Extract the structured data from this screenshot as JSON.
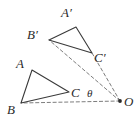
{
  "figure": {
    "background_color": "#ffffff",
    "stroke_color": "#3a3a3a",
    "dash_color": "#6e6e6e",
    "width": 139,
    "height": 124
  },
  "labels": {
    "A": "A",
    "B": "B",
    "C": "C",
    "A_prime": "A′",
    "B_prime": "B′",
    "C_prime": "C′",
    "theta": "θ",
    "O": "O"
  },
  "geometry": {
    "triangle_original": {
      "name": "ABC",
      "vertices": [
        {
          "label": "A",
          "x": 32,
          "y": 70
        },
        {
          "label": "B",
          "x": 21,
          "y": 103
        },
        {
          "label": "C",
          "x": 69,
          "y": 92
        }
      ],
      "style": "solid"
    },
    "triangle_image": {
      "name": "A′B′C′",
      "vertices": [
        {
          "label": "A′",
          "x": 76,
          "y": 27
        },
        {
          "label": "B′",
          "x": 49,
          "y": 40
        },
        {
          "label": "C′",
          "x": 92,
          "y": 53
        }
      ],
      "style": "solid"
    },
    "center": {
      "label": "O",
      "x": 120,
      "y": 101,
      "marker": "filled-dot"
    },
    "rays": [
      {
        "name": "ray-O-to-B",
        "from": "O",
        "to": "B",
        "x1": 120,
        "y1": 101,
        "x2": 21,
        "y2": 103,
        "style": "dashed"
      },
      {
        "name": "ray-O-to-C-prime",
        "from": "O",
        "to": "C′",
        "x1": 120,
        "y1": 101,
        "x2": 92,
        "y2": 53,
        "style": "dashed"
      },
      {
        "name": "ray-O-to-B-prime",
        "from": "O",
        "to": "B′",
        "x1": 120,
        "y1": 101,
        "x2": 49,
        "y2": 40,
        "style": "dashed"
      }
    ],
    "angle": {
      "label": "θ",
      "vertex": "O",
      "between": [
        "ray-O-to-B",
        "ray-O-to-C-prime"
      ],
      "label_x": 88,
      "label_y": 89
    }
  },
  "label_positions": {
    "A": {
      "x": 16,
      "y": 57
    },
    "B": {
      "x": 7,
      "y": 103
    },
    "C": {
      "x": 71,
      "y": 86
    },
    "A_prime": {
      "x": 61,
      "y": 6
    },
    "B_prime": {
      "x": 27,
      "y": 28
    },
    "C_prime": {
      "x": 94,
      "y": 51
    },
    "theta": {
      "x": 87,
      "y": 88
    },
    "O": {
      "x": 124,
      "y": 95
    }
  }
}
